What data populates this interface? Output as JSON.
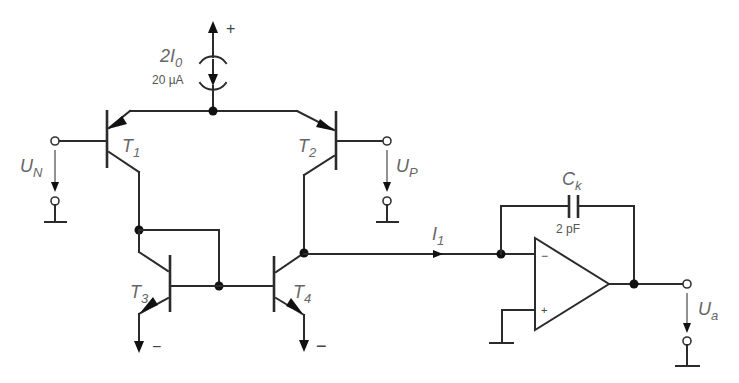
{
  "diagram": {
    "type": "circuit-schematic",
    "current_source": {
      "label": "2I",
      "label_sub": "0",
      "value": "20 µA",
      "supply_sign": "+"
    },
    "transistors": [
      {
        "id": "T1",
        "label": "T",
        "sub": "1",
        "type": "pnp"
      },
      {
        "id": "T2",
        "label": "T",
        "sub": "2",
        "type": "pnp"
      },
      {
        "id": "T3",
        "label": "T",
        "sub": "3",
        "type": "npn"
      },
      {
        "id": "T4",
        "label": "T",
        "sub": "4",
        "type": "npn"
      }
    ],
    "inputs": {
      "un": {
        "label": "U",
        "sub": "N"
      },
      "up": {
        "label": "U",
        "sub": "P"
      }
    },
    "current": {
      "label": "I",
      "sub": "1"
    },
    "capacitor": {
      "label": "C",
      "sub": "k",
      "value": "2 pF"
    },
    "opamp": {
      "inv_sign": "−",
      "noninv_sign": "+"
    },
    "output": {
      "label": "U",
      "sub": "a"
    },
    "supply_negative": "−"
  }
}
